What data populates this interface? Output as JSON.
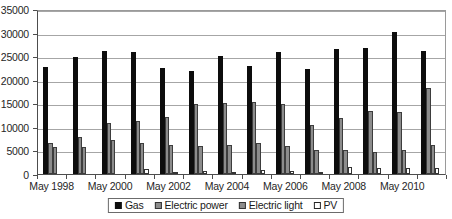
{
  "chart_data": {
    "type": "bar",
    "title": "",
    "subtitle": "",
    "xlabel": "",
    "ylabel": "",
    "ylim": [
      0,
      35000
    ],
    "ytick_labels": [
      "0",
      "5000",
      "10000",
      "15000",
      "20000",
      "25000",
      "30000",
      "35000"
    ],
    "ytick_values": [
      0,
      5000,
      10000,
      15000,
      20000,
      25000,
      30000,
      35000
    ],
    "grid": true,
    "legend_position": "bottom",
    "categories": [
      "May 1998",
      "May 1999",
      "May 2000",
      "May 2001",
      "May 2002",
      "May 2003",
      "May 2004",
      "May 2005",
      "May 2006",
      "May 2007",
      "May 2008",
      "May 2009",
      "May 2010",
      "May 2011"
    ],
    "xtick_labels": [
      "May 1998",
      "May 2000",
      "May 2002",
      "May 2004",
      "May 2006",
      "May 2008",
      "May 2010"
    ],
    "xtick_label_indices": [
      0,
      2,
      4,
      6,
      8,
      10,
      12
    ],
    "series": [
      {
        "name": "Gas",
        "color": "#0d0d0d",
        "values": [
          22600,
          24800,
          26200,
          25900,
          22500,
          21900,
          25100,
          22900,
          25800,
          22300,
          26600,
          26700,
          30200,
          26000
        ]
      },
      {
        "name": "Electric power",
        "color": "#8c8c8c",
        "values": [
          6500,
          7900,
          10800,
          11300,
          12200,
          14800,
          15000,
          15200,
          14900,
          10400,
          11900,
          13300,
          13200,
          18200
        ]
      },
      {
        "name": "Electric light",
        "color": "#8c8c8c",
        "values": [
          5700,
          5700,
          7200,
          6500,
          6200,
          6000,
          6100,
          6500,
          6000,
          5200,
          5100,
          4600,
          5200,
          6100
        ]
      },
      {
        "name": "PV",
        "color": "#ffffff",
        "values": [
          0,
          0,
          0,
          1000,
          500,
          650,
          400,
          750,
          650,
          250,
          1500,
          1250,
          1350,
          1300
        ]
      }
    ]
  },
  "legend": {
    "items": [
      {
        "label": "Gas",
        "swatch": "gas-swatch"
      },
      {
        "label": "Electric power",
        "swatch": "electric-power-swatch"
      },
      {
        "label": "Electric light",
        "swatch": "electric-light-swatch"
      },
      {
        "label": "PV",
        "swatch": "pv-swatch"
      }
    ]
  }
}
